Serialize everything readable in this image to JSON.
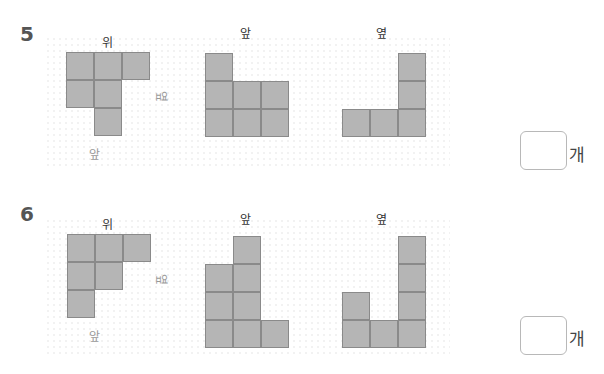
{
  "problems": [
    {
      "number": "5",
      "labels": {
        "top": "위",
        "front": "앞",
        "side": "옆"
      },
      "top_view": {
        "rows": [
          [
            1,
            1,
            1
          ],
          [
            1,
            1,
            0
          ],
          [
            0,
            1,
            0
          ]
        ]
      },
      "front_view": {
        "column_heights": [
          3,
          2,
          2
        ]
      },
      "side_view": {
        "column_heights": [
          1,
          1,
          3
        ]
      },
      "answer": {
        "value": "",
        "unit": "개"
      }
    },
    {
      "number": "6",
      "labels": {
        "top": "위",
        "front": "앞",
        "side": "옆"
      },
      "top_view": {
        "rows": [
          [
            1,
            1,
            1
          ],
          [
            1,
            1,
            0
          ],
          [
            1,
            0,
            0
          ]
        ]
      },
      "front_view": {
        "column_heights": [
          3,
          4,
          1
        ]
      },
      "side_view": {
        "column_heights": [
          2,
          1,
          4
        ]
      },
      "answer": {
        "value": "",
        "unit": "개"
      }
    }
  ],
  "colors": {
    "cell_fill": "#b5b5b5",
    "cell_border": "#8a8a8a"
  }
}
